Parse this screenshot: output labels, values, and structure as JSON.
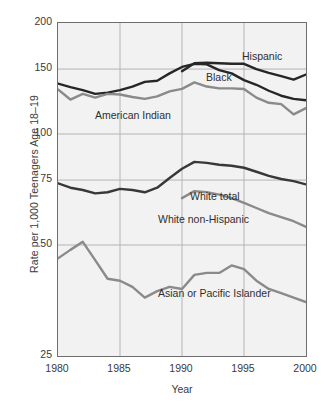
{
  "chart_data": {
    "type": "line",
    "title": "",
    "xlabel": "Year",
    "ylabel": "Rate per 1,000 Teenagers Age 18–19",
    "xlim": [
      1980,
      2000
    ],
    "ylim": [
      25,
      200
    ],
    "yscale": "log",
    "grid": true,
    "legend_position": "inline-annotations",
    "xticks": [
      1980,
      1985,
      1990,
      1995,
      2000
    ],
    "xtick_labels": [
      "1980",
      "1985",
      "1990",
      "1995",
      "2000"
    ],
    "yticks": [
      25,
      50,
      75,
      100,
      150,
      200
    ],
    "ytick_labels": [
      "25",
      "50",
      "75",
      "100",
      "150",
      "200"
    ],
    "x": [
      1980,
      1981,
      1982,
      1983,
      1984,
      1985,
      1986,
      1987,
      1988,
      1989,
      1990,
      1991,
      1992,
      1993,
      1994,
      1995,
      1996,
      1997,
      1998,
      1999,
      2000
    ],
    "series": [
      {
        "name": "Hispanic",
        "color": "#262626",
        "x": [
          1990,
          1991,
          1992,
          1993,
          1994,
          1995,
          1996,
          1997,
          1998,
          1999,
          2000
        ],
        "values": [
          148.0,
          155.5,
          156.0,
          155.5,
          155.0,
          155.0,
          150.0,
          146.5,
          143.5,
          140.5,
          145.0
        ]
      },
      {
        "name": "Black",
        "color": "#262626",
        "x": [
          1980,
          1981,
          1982,
          1983,
          1984,
          1985,
          1986,
          1987,
          1988,
          1989,
          1990,
          1991,
          1992,
          1993,
          1994,
          1995,
          1996,
          1997,
          1998,
          1999,
          2000
        ],
        "values": [
          137.0,
          134.0,
          131.5,
          128.5,
          129.5,
          131.5,
          134.5,
          138.5,
          139.5,
          146.0,
          152.0,
          155.0,
          154.5,
          149.0,
          146.0,
          140.0,
          136.0,
          131.0,
          127.0,
          124.5,
          123.5
        ]
      },
      {
        "name": "American Indian",
        "color": "#8a8a8a",
        "x": [
          1980,
          1981,
          1982,
          1983,
          1984,
          1985,
          1986,
          1987,
          1988,
          1989,
          1990,
          1991,
          1992,
          1993,
          1994,
          1995,
          1996,
          1997,
          1998,
          1999,
          2000
        ],
        "values": [
          132.0,
          124.0,
          128.5,
          125.5,
          128.5,
          128.0,
          126.0,
          124.5,
          126.5,
          130.5,
          132.5,
          138.0,
          134.5,
          133.0,
          133.0,
          132.5,
          125.5,
          121.5,
          120.5,
          113.0,
          117.5
        ]
      },
      {
        "name": "White total",
        "color": "#383838",
        "x": [
          1980,
          1981,
          1982,
          1983,
          1984,
          1985,
          1986,
          1987,
          1988,
          1989,
          1990,
          1991,
          1992,
          1993,
          1994,
          1995,
          1996,
          1997,
          1998,
          1999,
          2000
        ],
        "values": [
          73.5,
          71.5,
          70.5,
          69.0,
          69.5,
          71.0,
          70.5,
          69.5,
          71.5,
          76.0,
          80.5,
          84.0,
          83.5,
          82.5,
          82.0,
          81.0,
          79.0,
          77.0,
          75.5,
          74.5,
          73.0
        ]
      },
      {
        "name": "White non-Hispanic",
        "color": "#8a8a8a",
        "x": [
          1990,
          1991,
          1992,
          1993,
          1994,
          1995,
          1996,
          1997,
          1998,
          1999,
          2000
        ],
        "values": [
          67.0,
          70.0,
          69.5,
          68.5,
          67.0,
          65.0,
          63.0,
          61.0,
          59.5,
          58.0,
          56.0
        ]
      },
      {
        "name": "Asian or Pacific Islander",
        "color": "#8a8a8a",
        "x": [
          1980,
          1981,
          1982,
          1983,
          1984,
          1985,
          1986,
          1987,
          1988,
          1989,
          1990,
          1991,
          1992,
          1993,
          1994,
          1995,
          1996,
          1997,
          1998,
          1999,
          2000
        ],
        "values": [
          46.0,
          48.5,
          51.0,
          45.5,
          40.5,
          40.0,
          38.5,
          36.0,
          37.5,
          38.5,
          38.0,
          41.5,
          42.0,
          42.0,
          44.0,
          43.0,
          40.0,
          38.0,
          37.0,
          36.0,
          35.0
        ]
      }
    ],
    "annotations": [
      {
        "text": "Hispanic",
        "series": "Hispanic"
      },
      {
        "text": "Black",
        "series": "Black"
      },
      {
        "text": "American Indian",
        "series": "American Indian"
      },
      {
        "text": "White total",
        "series": "White total"
      },
      {
        "text": "White non-Hispanic",
        "series": "White non-Hispanic"
      },
      {
        "text": "Asian or Pacific Islander",
        "series": "Asian or Pacific Islander"
      }
    ]
  },
  "style": {
    "plot_background": "#f2f2f2",
    "grid_color": "#b4b4b4",
    "frame_color": "#6e6e6e",
    "text_color": "#3a3a3a",
    "dark_series_color": "#262626",
    "gray_series_color": "#8a8a8a"
  }
}
